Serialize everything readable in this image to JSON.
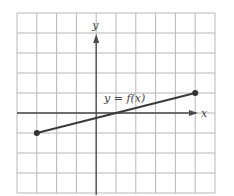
{
  "chart_data": {
    "type": "line",
    "title": "",
    "xlabel": "x",
    "ylabel": "y",
    "annotations": [
      {
        "text": "y = f(x)",
        "x": 0.4,
        "y": 0.8
      }
    ],
    "grid": true,
    "xlim": [
      -4,
      6
    ],
    "ylim": [
      -4,
      5
    ],
    "x_axis_position": 0,
    "y_axis_position": 0,
    "series": [
      {
        "name": "y = f(x)",
        "x": [
          -3,
          5
        ],
        "y": [
          -1,
          1
        ],
        "endpoints": "closed-dots"
      }
    ],
    "legend": []
  },
  "labels": {
    "x_axis": "x",
    "y_axis": "y",
    "function": "y = f(x)"
  },
  "colors": {
    "grid": "#b8b8b8",
    "axis": "#4a4a4a",
    "line": "#3a3a3a"
  }
}
